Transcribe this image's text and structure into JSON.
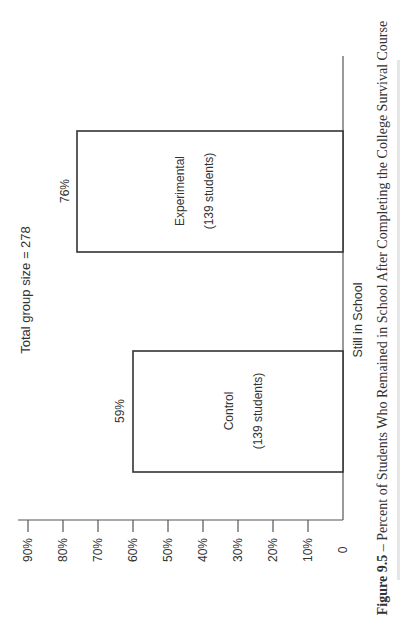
{
  "chart_data": {
    "type": "bar",
    "orientation": "rotated-90-ccw",
    "title": "Total group size = 278",
    "categories": [
      "Still in School"
    ],
    "series": [
      {
        "name": "Control",
        "sublabel": "(139 students)",
        "values": [
          59
        ],
        "value_label": "59%"
      },
      {
        "name": "Experimental",
        "sublabel": "(139 students)",
        "values": [
          76
        ],
        "value_label": "76%"
      }
    ],
    "xlabel": "Still in School",
    "ylabel": "",
    "ylim": [
      0,
      90
    ],
    "yticks": [
      "0",
      "10%",
      "20%",
      "30%",
      "40%",
      "50%",
      "60%",
      "70%",
      "80%",
      "90%"
    ],
    "grid": false,
    "legend": "none"
  },
  "caption": {
    "figure_label": "Figure 9.5",
    "text": " – Percent of Students Who Remained in School After Completing the College Survival Course"
  }
}
